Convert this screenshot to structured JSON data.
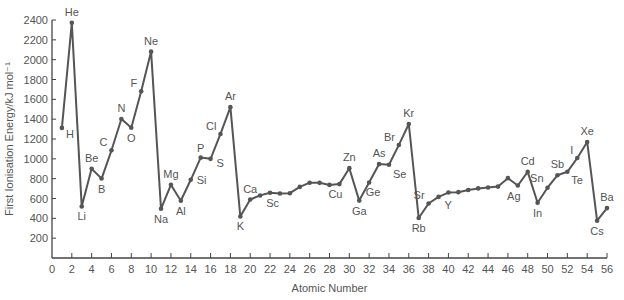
{
  "chart_data": {
    "type": "line",
    "title": "",
    "xlabel": "Atomic Number",
    "ylabel": "First Ionisation Energy/kJ mol⁻¹",
    "xlim": [
      0,
      56
    ],
    "ylim": [
      0,
      2400
    ],
    "xticks": [
      0,
      2,
      4,
      6,
      8,
      10,
      12,
      14,
      16,
      18,
      20,
      22,
      24,
      26,
      28,
      30,
      32,
      34,
      36,
      38,
      40,
      42,
      44,
      46,
      48,
      50,
      52,
      54,
      56
    ],
    "yticks": [
      200,
      400,
      600,
      800,
      1000,
      1200,
      1400,
      1600,
      1800,
      2000,
      2200,
      2400
    ],
    "grid": false,
    "line_color": "#555555",
    "points": [
      {
        "z": 1,
        "e": 1312,
        "label": "H"
      },
      {
        "z": 2,
        "e": 2372,
        "label": "He"
      },
      {
        "z": 3,
        "e": 520,
        "label": "Li"
      },
      {
        "z": 4,
        "e": 899,
        "label": "Be"
      },
      {
        "z": 5,
        "e": 801,
        "label": "B"
      },
      {
        "z": 6,
        "e": 1086,
        "label": "C"
      },
      {
        "z": 7,
        "e": 1402,
        "label": "N"
      },
      {
        "z": 8,
        "e": 1314,
        "label": "O"
      },
      {
        "z": 9,
        "e": 1681,
        "label": "F"
      },
      {
        "z": 10,
        "e": 2081,
        "label": "Ne"
      },
      {
        "z": 11,
        "e": 496,
        "label": "Na"
      },
      {
        "z": 12,
        "e": 738,
        "label": "Mg"
      },
      {
        "z": 13,
        "e": 578,
        "label": "Al"
      },
      {
        "z": 14,
        "e": 789,
        "label": "Si"
      },
      {
        "z": 15,
        "e": 1012,
        "label": "P"
      },
      {
        "z": 16,
        "e": 1000,
        "label": "S"
      },
      {
        "z": 17,
        "e": 1251,
        "label": "Cl"
      },
      {
        "z": 18,
        "e": 1521,
        "label": "Ar"
      },
      {
        "z": 19,
        "e": 419,
        "label": "K"
      },
      {
        "z": 20,
        "e": 590,
        "label": "Ca"
      },
      {
        "z": 21,
        "e": 631,
        "label": "Sc"
      },
      {
        "z": 22,
        "e": 658,
        "label": ""
      },
      {
        "z": 23,
        "e": 650,
        "label": ""
      },
      {
        "z": 24,
        "e": 653,
        "label": ""
      },
      {
        "z": 25,
        "e": 717,
        "label": ""
      },
      {
        "z": 26,
        "e": 759,
        "label": ""
      },
      {
        "z": 27,
        "e": 758,
        "label": ""
      },
      {
        "z": 28,
        "e": 737,
        "label": ""
      },
      {
        "z": 29,
        "e": 745,
        "label": "Cu"
      },
      {
        "z": 30,
        "e": 906,
        "label": "Zn"
      },
      {
        "z": 31,
        "e": 579,
        "label": "Ga"
      },
      {
        "z": 32,
        "e": 762,
        "label": "Ge"
      },
      {
        "z": 33,
        "e": 947,
        "label": "As"
      },
      {
        "z": 34,
        "e": 941,
        "label": "Se"
      },
      {
        "z": 35,
        "e": 1140,
        "label": "Br"
      },
      {
        "z": 36,
        "e": 1351,
        "label": "Kr"
      },
      {
        "z": 37,
        "e": 403,
        "label": "Rb"
      },
      {
        "z": 38,
        "e": 550,
        "label": "Sr"
      },
      {
        "z": 39,
        "e": 616,
        "label": "Y"
      },
      {
        "z": 40,
        "e": 660,
        "label": ""
      },
      {
        "z": 41,
        "e": 664,
        "label": ""
      },
      {
        "z": 42,
        "e": 685,
        "label": ""
      },
      {
        "z": 43,
        "e": 702,
        "label": ""
      },
      {
        "z": 44,
        "e": 711,
        "label": ""
      },
      {
        "z": 45,
        "e": 720,
        "label": ""
      },
      {
        "z": 46,
        "e": 805,
        "label": ""
      },
      {
        "z": 47,
        "e": 731,
        "label": "Ag"
      },
      {
        "z": 48,
        "e": 868,
        "label": "Cd"
      },
      {
        "z": 49,
        "e": 558,
        "label": "In"
      },
      {
        "z": 50,
        "e": 709,
        "label": "Sn"
      },
      {
        "z": 51,
        "e": 834,
        "label": "Sb"
      },
      {
        "z": 52,
        "e": 869,
        "label": "Te"
      },
      {
        "z": 53,
        "e": 1008,
        "label": "I"
      },
      {
        "z": 54,
        "e": 1170,
        "label": "Xe"
      },
      {
        "z": 55,
        "e": 376,
        "label": "Cs"
      },
      {
        "z": 56,
        "e": 503,
        "label": "Ba"
      }
    ]
  }
}
